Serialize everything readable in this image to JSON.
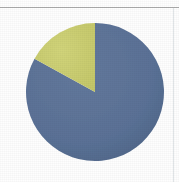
{
  "figure": {
    "background_color": "#fefefe",
    "width": 179,
    "height": 182,
    "top_rule_color": "#9b9b9b",
    "right_rule_color": "#c9cfd6"
  },
  "chart_data": {
    "type": "pie",
    "title": "",
    "subtitle": "",
    "xlabel": "",
    "ylabel": "",
    "grid": false,
    "legend": false,
    "legend_position": "none",
    "start_angle_deg": 0,
    "direction": "counterclockwise",
    "center": {
      "x": 95,
      "y": 92
    },
    "radius": 69,
    "labels": [
      "Series 1",
      "Series 2"
    ],
    "values": [
      83,
      17
    ],
    "percentages": [
      "83%",
      "17%"
    ],
    "colors": [
      "#5a7196",
      "#c9cc70"
    ],
    "slices": [
      {
        "label": "Series 1",
        "value": 83,
        "percent": "83%",
        "color": "#5a7196",
        "start_angle_deg": 0,
        "end_angle_deg": 298
      },
      {
        "label": "Series 2",
        "value": 17,
        "percent": "17%",
        "color": "#c9cc70",
        "start_angle_deg": 298,
        "end_angle_deg": 360
      }
    ],
    "annotations": []
  }
}
